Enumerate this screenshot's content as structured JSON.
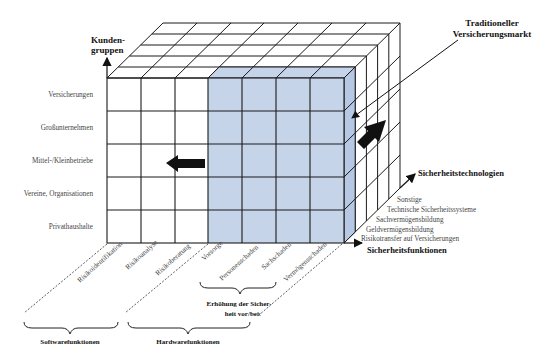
{
  "diagram": {
    "colors": {
      "highlight": "#c6d4ea",
      "highlight_side": "#b7c8e4",
      "grid": "#1a1a1a",
      "text": "#444444"
    },
    "axes": {
      "y_title_1": "Kunden-",
      "y_title_2": "gruppen",
      "depth_title": "Sicherheitstechnologien",
      "x_title": "Sicherheitsfunktionen"
    },
    "annotation": {
      "line1": "Traditioneller",
      "line2": "Versicherungsmarkt"
    },
    "rows": [
      "Versicherungen",
      "Großunternehmen",
      "Mittel-/Kleinbetriebe",
      "Vereine, Organisationen",
      "Privathaushalte"
    ],
    "columns": [
      "Risikoidentifikation",
      "Risikoanalyse",
      "Risikoberatung",
      "Vorsorge",
      "Personenschaden",
      "Sachschaden",
      "Vermögensschaden"
    ],
    "depth_layers": [
      "Sonstige",
      "Technische Sicherheitssysteme",
      "Sachvermögensbildung",
      "Geldvermögensbildung",
      "Risikotransfer auf Versicherungen"
    ],
    "groups": {
      "software": "Softwarefunktionen",
      "hardware": "Hardwarefunktionen",
      "increase_1": "Erhöhung der Sicher-",
      "increase_2": "heit vor/bei:"
    }
  }
}
